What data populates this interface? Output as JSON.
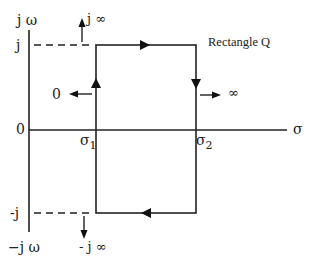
{
  "diagram": {
    "title": "Rectangle Q",
    "axes": {
      "vertical_top_label": "j ω",
      "vertical_bottom_label": "−j ω",
      "horizontal_label": "σ",
      "origin_label": "0",
      "j_label": "j",
      "neg_j_label": "-j"
    },
    "points": {
      "sigma1": "σ",
      "sigma1_sub": "1",
      "sigma2": "σ",
      "sigma2_sub": "2"
    },
    "mappings": {
      "top_left_arrow": "j ∞",
      "bottom_left_arrow": "- j ∞",
      "left_edge_arrow": "0",
      "right_edge_arrow": "∞"
    },
    "colors": {
      "line": "#222222",
      "background": "#ffffff"
    }
  }
}
